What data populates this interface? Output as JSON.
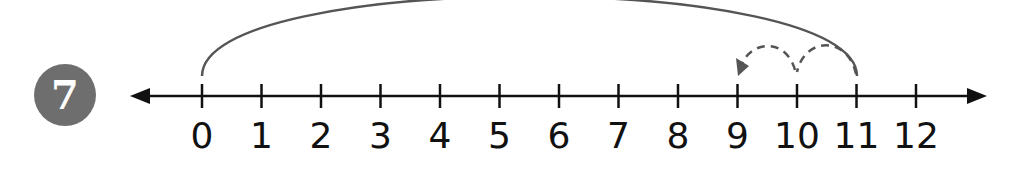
{
  "problem": {
    "number": "7"
  },
  "number_line": {
    "min": 0,
    "max": 12,
    "labels": [
      "0",
      "1",
      "2",
      "3",
      "4",
      "5",
      "6",
      "7",
      "8",
      "9",
      "10",
      "11",
      "12"
    ],
    "arrows": "both-ends"
  },
  "jumps": [
    {
      "from": 0,
      "to": 11,
      "style": "solid",
      "description": "big arc from 0 to 11"
    },
    {
      "from": 11,
      "to": 10,
      "style": "dashed"
    },
    {
      "from": 10,
      "to": 9,
      "style": "dashed",
      "arrowhead": true
    }
  ],
  "colors": {
    "axis": "#111111",
    "arc": "#555555",
    "dashed": "#555555",
    "badge": "#6e6e6e",
    "badge_text": "#ffffff"
  }
}
